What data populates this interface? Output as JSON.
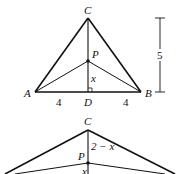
{
  "figure1": {
    "vertices": {
      "A": "A",
      "B": "B",
      "C": "C",
      "D": "D",
      "P": "P"
    },
    "segment_labels": {
      "AD": "4",
      "DB": "4",
      "PD": "x",
      "height": "5"
    }
  },
  "figure2": {
    "vertices": {
      "C": "C",
      "P": "P"
    },
    "segment_labels": {
      "CP": "2 − x",
      "PD": "x"
    }
  },
  "colors": {
    "stroke": "#111111",
    "background": "#ffffff"
  }
}
